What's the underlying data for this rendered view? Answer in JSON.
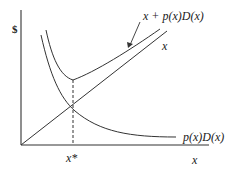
{
  "diagram": {
    "y_axis_label": "$",
    "x_axis_label": "x",
    "optimum_label": "x*",
    "curves": {
      "total_cost": {
        "label": "x + p(x)D(x)"
      },
      "linear": {
        "label": "x"
      },
      "expected_damage": {
        "label": "p(x)D(x)"
      }
    },
    "colors": {
      "ink": "#333333",
      "background": "#ffffff"
    }
  }
}
